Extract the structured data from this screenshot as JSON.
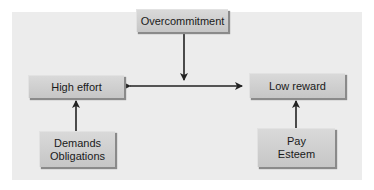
{
  "diagram": {
    "nodes": {
      "overcommitment": {
        "label": "Overcommitment"
      },
      "high_effort": {
        "label": "High effort"
      },
      "low_reward": {
        "label": "Low reward"
      },
      "demands": {
        "line1": "Demands",
        "line2": "Obligations"
      },
      "pay": {
        "line1": "Pay",
        "line2": "Esteem"
      }
    },
    "edges": [
      {
        "from": "overcommitment",
        "to": "horizontal-link",
        "direction": "down"
      },
      {
        "from": "high_effort",
        "to": "low_reward",
        "direction": "bidirectional"
      },
      {
        "from": "demands",
        "to": "high_effort",
        "direction": "up"
      },
      {
        "from": "pay",
        "to": "low_reward",
        "direction": "up"
      }
    ],
    "colors": {
      "panel": "#ececec",
      "box": "#cfcfcf",
      "arrow": "#222222"
    }
  }
}
